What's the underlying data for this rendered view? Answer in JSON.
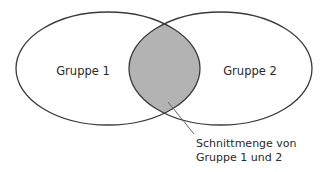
{
  "diagram": {
    "type": "venn",
    "sets": [
      {
        "id": "g1",
        "label": "Gruppe 1"
      },
      {
        "id": "g2",
        "label": "Gruppe 2"
      }
    ],
    "intersection": {
      "of": [
        "g1",
        "g2"
      ],
      "annotation_lines": [
        "Schnittmenge von",
        "Gruppe 1 und 2"
      ],
      "fill_color": "#b3b3b3"
    },
    "stroke_color": "#3a3a3a",
    "leader_color": "#6a6a6a",
    "background_color": "#ffffff"
  }
}
